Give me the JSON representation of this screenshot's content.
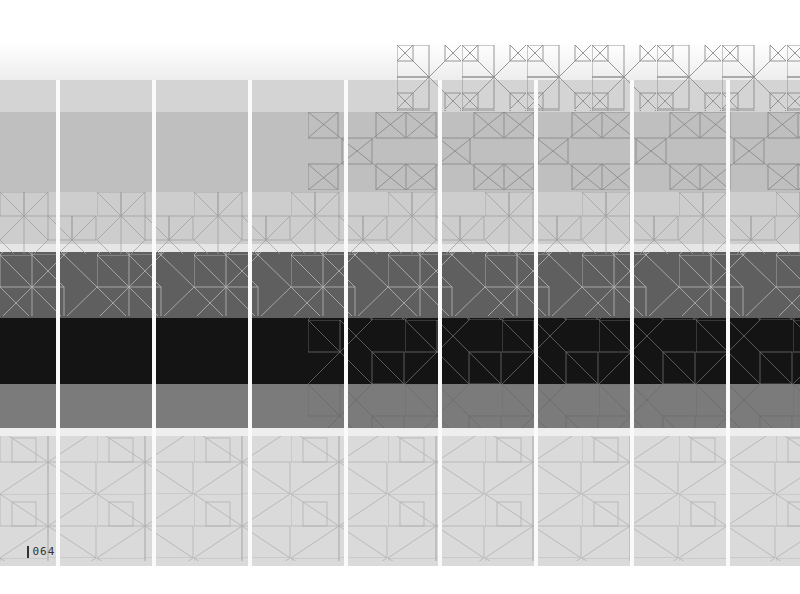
{
  "page": {
    "number": "064"
  },
  "artwork": {
    "columns": 9,
    "bands": [
      {
        "name": "top-fade",
        "color": "#e9e9e9"
      },
      {
        "name": "light-gray",
        "color": "#cfcfcf"
      },
      {
        "name": "mid-gray",
        "color": "#bdbdbd"
      },
      {
        "name": "dark-gray",
        "color": "#5e5e5e"
      },
      {
        "name": "black",
        "color": "#151515"
      },
      {
        "name": "gray",
        "color": "#7a7a7a"
      },
      {
        "name": "pale-bottom",
        "color": "#dcdcdc"
      }
    ],
    "line_color": "#8a8a8a",
    "line_color_light": "#c8c8c8"
  }
}
